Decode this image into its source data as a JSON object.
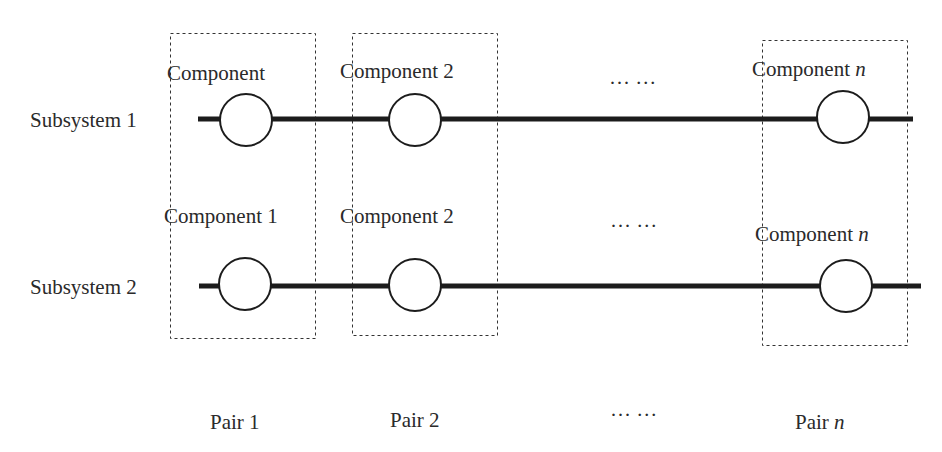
{
  "subsystems": [
    {
      "label": "Subsystem 1",
      "components": [
        {
          "label": "Component",
          "suffix": ""
        },
        {
          "label": "Component 2",
          "suffix": ""
        },
        {
          "label": "Component ",
          "suffix": "n"
        }
      ],
      "ellipsis": "··· ···"
    },
    {
      "label": "Subsystem 2",
      "components": [
        {
          "label": "Component 1",
          "suffix": ""
        },
        {
          "label": "Component 2",
          "suffix": ""
        },
        {
          "label": "Component ",
          "suffix": "n"
        }
      ],
      "ellipsis": "··· ···"
    }
  ],
  "pairs": [
    {
      "label": "Pair 1",
      "suffix": ""
    },
    {
      "label": "Pair 2",
      "suffix": ""
    },
    {
      "label": "Pair ",
      "suffix": "n"
    }
  ],
  "pairs_ellipsis": "··· ···",
  "colors": {
    "line": "#1c1c1c",
    "text": "#2a2a2a",
    "box": "#333333"
  }
}
